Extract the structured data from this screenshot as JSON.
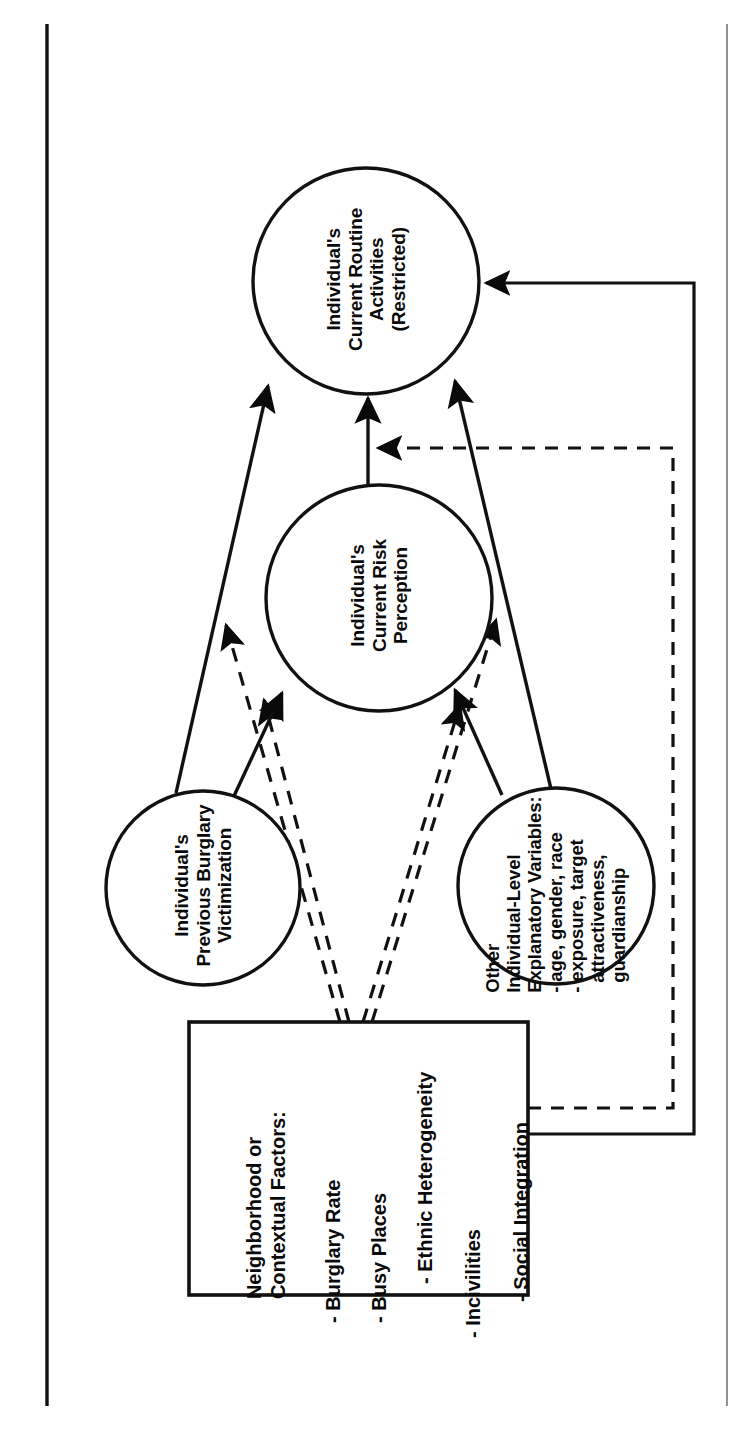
{
  "diagram": {
    "type": "conceptual-path-diagram",
    "orientation": "rotated-90-ccw",
    "page_frame": {
      "left_rule": true,
      "right_rule": true
    },
    "nodes": [
      {
        "id": "routine-activities",
        "shape": "circle",
        "label": "Individual's\nCurrent Routine\nActivities\n(Restricted)",
        "cx": 366,
        "cy": 281,
        "r": 113
      },
      {
        "id": "risk-perception",
        "shape": "circle",
        "label": "Individual's\nCurrent Risk\nPerception",
        "cx": 379,
        "cy": 598,
        "r": 113
      },
      {
        "id": "previous-victimization",
        "shape": "circle",
        "label": "Individual's\nPrevious Burglary\nVictimization",
        "cx": 203,
        "cy": 888,
        "r": 97
      },
      {
        "id": "other-individual-level",
        "shape": "circle",
        "label": "Other\nIndividual-Level\nExplanatory Variables:\n- age, gender, race\n- exposure, target\n  attractiveness,\n  guardianship",
        "cx": 556,
        "cy": 886,
        "r": 98
      },
      {
        "id": "neighborhood-factors",
        "shape": "rect",
        "heading": "Neighborhood or\nContextual Factors:",
        "items": [
          "- Burglary Rate",
          "- Busy Places",
          "- Ethnic Heterogeneity",
          "- Incivilities",
          "- Social Integration"
        ],
        "x": 189,
        "y": 1022,
        "width": 339,
        "height": 273
      }
    ],
    "edges": [
      {
        "id": "risk-to-routine",
        "from": "risk-perception",
        "to": "routine-activities",
        "style": "solid",
        "arrow": "to"
      },
      {
        "id": "prev-to-routine",
        "from": "previous-victimization",
        "to": "routine-activities",
        "style": "solid",
        "arrow": "to"
      },
      {
        "id": "other-to-routine",
        "from": "other-individual-level",
        "to": "routine-activities",
        "style": "solid",
        "arrow": "to"
      },
      {
        "id": "prev-to-risk",
        "from": "previous-victimization",
        "to": "risk-perception",
        "style": "solid",
        "arrow": "to"
      },
      {
        "id": "other-to-risk",
        "from": "other-individual-level",
        "to": "risk-perception",
        "style": "solid",
        "arrow": "to"
      },
      {
        "id": "neighborhood-to-routine-left",
        "from": "neighborhood-factors",
        "to": "routine-activities",
        "style": "dashed",
        "arrow": "to"
      },
      {
        "id": "neighborhood-to-risk-left",
        "from": "neighborhood-factors",
        "to": "risk-perception",
        "style": "dashed",
        "arrow": "to"
      },
      {
        "id": "neighborhood-to-routine-right",
        "from": "neighborhood-factors",
        "to": "routine-activities",
        "style": "dashed",
        "arrow": "to"
      },
      {
        "id": "neighborhood-to-risk-right",
        "from": "neighborhood-factors",
        "to": "risk-perception",
        "style": "dashed",
        "arrow": "to"
      },
      {
        "id": "neighborhood-solid-to-routine",
        "from": "neighborhood-factors",
        "to": "routine-activities",
        "style": "solid",
        "arrow": "to",
        "routing": "orthogonal-right"
      },
      {
        "id": "neighborhood-dashed-to-routine-feeder",
        "from": "neighborhood-factors",
        "to": "routine-activities",
        "style": "dashed",
        "arrow": "to",
        "routing": "orthogonal-right"
      }
    ],
    "colors": {
      "ink": "#0a0a0a",
      "background": "#ffffff"
    }
  }
}
